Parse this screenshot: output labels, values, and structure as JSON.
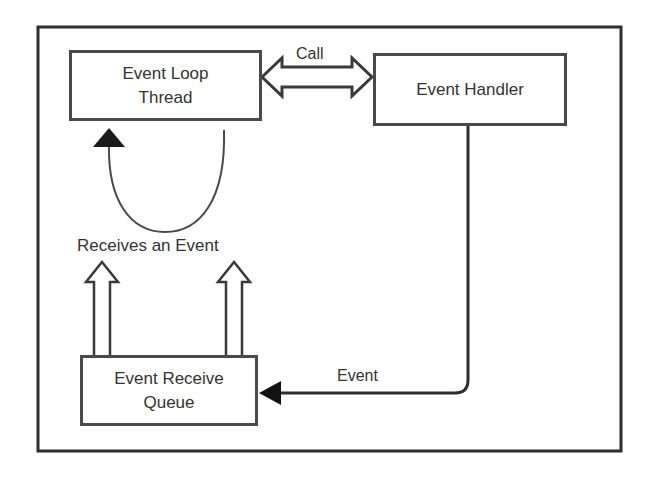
{
  "diagram": {
    "nodes": {
      "event_loop_thread": {
        "line1": "Event Loop",
        "line2": "Thread"
      },
      "event_handler": {
        "label": "Event Handler"
      },
      "event_receive_queue": {
        "line1": "Event Receive",
        "line2": "Queue"
      }
    },
    "edges": {
      "call": {
        "label": "Call",
        "from": "Event Loop Thread",
        "to": "Event Handler",
        "style": "hollow double-headed arrow"
      },
      "loop": {
        "label": "Receives an Event",
        "from": "Event Loop Thread",
        "to": "Event Loop Thread",
        "style": "curved arrow with solid head"
      },
      "receive": {
        "from": "Event Receive Queue",
        "to": "Receives an Event",
        "style": "two hollow upward arrows"
      },
      "event": {
        "label": "Event",
        "from": "Event Handler",
        "to": "Event Receive Queue",
        "style": "line with solid arrowhead"
      }
    },
    "colors": {
      "stroke": "#3a3a3a",
      "text": "#333333",
      "background": "#ffffff"
    }
  }
}
